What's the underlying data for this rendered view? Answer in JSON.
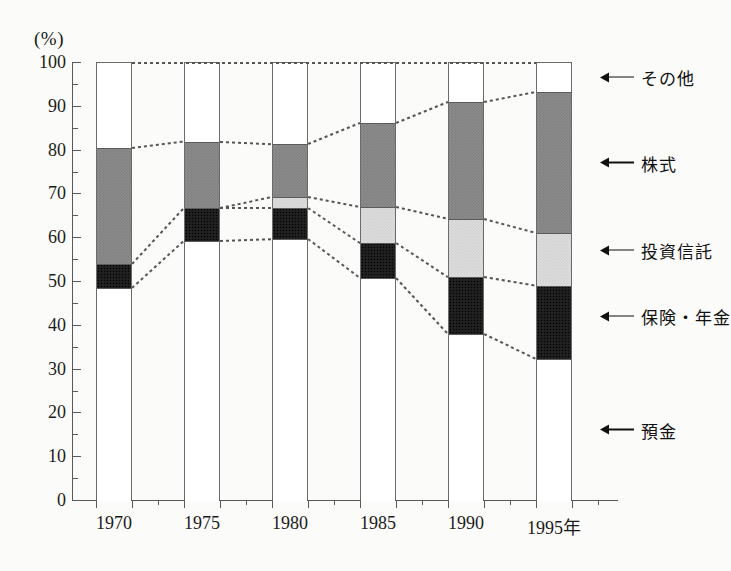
{
  "chart_data": {
    "type": "bar",
    "subtype": "stacked-100-percent",
    "title": "",
    "xlabel": "",
    "ylabel": "(%)",
    "unit_label": "(%)",
    "categories": [
      "1970",
      "1975",
      "1980",
      "1985",
      "1990",
      "1995年"
    ],
    "ylim": [
      0,
      100
    ],
    "ytick_step": 10,
    "yticks": [
      "0",
      "10",
      "20",
      "30",
      "40",
      "50",
      "60",
      "70",
      "80",
      "90",
      "100"
    ],
    "minor_ytick_step": 5,
    "grid": false,
    "legend_position": "right-of-bars-with-arrows",
    "series": [
      {
        "name": "預金",
        "key": "deposits",
        "color": "#ffffff",
        "values": [
          48.6,
          59.4,
          59.8,
          50.9,
          38.1,
          32.4
        ]
      },
      {
        "name": "保険・年金",
        "key": "insurance",
        "color": "#1d1d1d",
        "values": [
          5.5,
          7.5,
          7.1,
          8.0,
          13.0,
          16.7
        ]
      },
      {
        "name": "投資信託",
        "key": "trust",
        "color": "#dedede",
        "values": [
          0.0,
          0.0,
          2.5,
          8.2,
          13.3,
          12.1
        ]
      },
      {
        "name": "株式",
        "key": "stocks",
        "color": "#8c8c8c",
        "values": [
          26.4,
          15.1,
          12.1,
          19.2,
          26.7,
          32.2
        ]
      },
      {
        "name": "その他",
        "key": "other",
        "color": "#ffffff",
        "values": [
          19.5,
          18.0,
          18.5,
          13.7,
          8.9,
          6.6
        ]
      }
    ],
    "cumulative_boundaries": {
      "deposits_top": [
        48.6,
        59.4,
        59.8,
        50.9,
        38.1,
        32.4
      ],
      "insurance_top": [
        54.1,
        66.9,
        66.9,
        58.9,
        51.1,
        49.1
      ],
      "trust_top": [
        54.1,
        66.9,
        69.4,
        67.1,
        64.4,
        61.2
      ],
      "stocks_top": [
        80.5,
        82.0,
        81.5,
        86.3,
        91.1,
        93.4
      ],
      "other_top": [
        100,
        100,
        100,
        100,
        100,
        100
      ]
    }
  },
  "legend": {
    "items": [
      {
        "label": "その他",
        "at_percent": 96.5,
        "icon": "left-arrow-icon"
      },
      {
        "label": "株式",
        "at_percent": 77.0,
        "icon": "left-arrow-icon"
      },
      {
        "label": "投資信託",
        "at_percent": 57.0,
        "icon": "left-arrow-icon"
      },
      {
        "label": "保険・年金",
        "at_percent": 42.0,
        "icon": "left-arrow-icon"
      },
      {
        "label": "預金",
        "at_percent": 16.0,
        "icon": "left-arrow-icon"
      }
    ]
  }
}
